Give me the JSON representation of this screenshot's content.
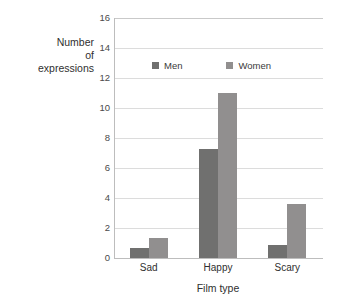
{
  "chart_data": {
    "type": "bar",
    "title": "",
    "xlabel": "Film type",
    "ylabel": "Number of expressions",
    "ylabel_lines": [
      "Number",
      "of",
      "expressions"
    ],
    "categories": [
      "Sad",
      "Happy",
      "Scary"
    ],
    "series": [
      {
        "name": "Men",
        "values": [
          0.7,
          7.3,
          0.9
        ],
        "color": "#70706f"
      },
      {
        "name": "Women",
        "values": [
          1.35,
          11.0,
          3.6
        ],
        "color": "#918f8f"
      }
    ],
    "ylim": [
      0,
      16
    ],
    "yticks": [
      0,
      2,
      4,
      6,
      8,
      10,
      12,
      14,
      16
    ],
    "ytick_labels": [
      "0",
      "2",
      "4",
      "6",
      "8",
      "10",
      "12",
      "14",
      "16"
    ],
    "grid": true,
    "grid_axis": "y",
    "legend_position": "inside-top-center",
    "legend_entries": [
      "Men",
      "Women"
    ]
  },
  "axis": {
    "y_title_line1": "Number",
    "y_title_line2": "of",
    "y_title_line3": "expressions",
    "x_title": "Film type"
  },
  "legend": {
    "men_label": "Men",
    "women_label": "Women"
  },
  "colors": {
    "men": "#70706f",
    "women": "#918f8f",
    "grid": "#dcdcdc",
    "axis": "#bdbdbd",
    "text": "#2f2f2f",
    "background": "#ffffff"
  }
}
